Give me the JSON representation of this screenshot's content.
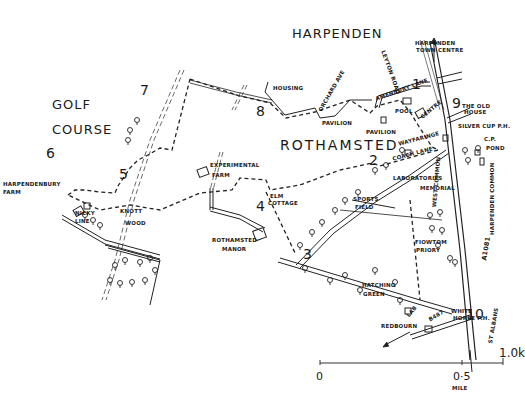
{
  "map": {
    "title_labels": {
      "harpenden": "HARPENDEN",
      "golf": "GOLF",
      "course": "COURSE",
      "rothamsted": "ROTHAMSTED"
    },
    "place_labels": {
      "harpenden_town_centre_1": "HARPENDEN",
      "harpenden_town_centre_2": "TOWN CENTRE",
      "leyton_road": "LEYTON ROAD",
      "housing": "HOUSING",
      "orchard_ave": "ORCHARD AVE",
      "amenbury_lane": "AMENBURY LANE",
      "pool": "POOL",
      "centre": "CENTRE",
      "pavilion_1": "PAVILION",
      "pavilion_2": "PAVILION",
      "the_old_house_1": "THE OLD",
      "the_old_house_2": "HOUSE",
      "silver_cup": "SILVER CUP P.H.",
      "car_park": "C.P.",
      "pond": "POND",
      "waytaringe": "WAYFARINGE",
      "coach_lane": "COACH LANE",
      "laboratories": "LABORATORIES",
      "memorial": "MEMORIAL",
      "harpendenbury_farm_1": "HARPENDENBURY",
      "harpendenbury_farm_2": "FARM",
      "nicky_line_1": "NICKY",
      "nicky_line_2": "LINE",
      "knott_wood_1": "KNOTT",
      "knott_wood_2": "WOOD",
      "experimental_farm_1": "EXPERIMENTAL",
      "experimental_farm_2": "FARM",
      "elm_cottage_1": "ELM",
      "elm_cottage_2": "COTTAGE",
      "sports_field_1": "SPORTS",
      "sports_field_2": "FIELD",
      "rothamsted_manor_1": "ROTHAMSTED",
      "rothamsted_manor_2": "MANOR",
      "west_common": "WEST COMMON",
      "harpenden_common": "HARPENDEN COMMON",
      "a1081": "A1081",
      "fiowtom_priory_1": "FIOWTOM",
      "fiowtom_priory_2": "PRIORY",
      "hatching_green_1": "HATCHING",
      "hatching_green_2": "GREEN",
      "lab": "LAB",
      "b487": "B487",
      "white_horse_1": "WHITE",
      "white_horse_2": "HORSE P.H.",
      "redbourn": "REDBOURN",
      "st_albans": "ST ALBANS"
    },
    "waypoints": [
      "1",
      "2",
      "3",
      "4",
      "5",
      "6",
      "7",
      "8",
      "9",
      "10"
    ],
    "scale_bar": {
      "start": "0",
      "mid": "0·5",
      "mid_unit": "MILE",
      "end": "1.0k"
    }
  }
}
